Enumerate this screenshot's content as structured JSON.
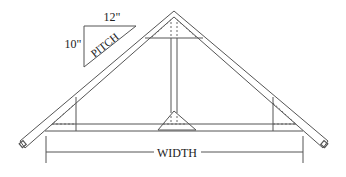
{
  "diagram": {
    "type": "roof-truss",
    "pitch_indicator": {
      "run_label": "12\"",
      "rise_label": "10\"",
      "title": "PITCH"
    },
    "dimension": {
      "label": "WIDTH"
    },
    "colors": {
      "line": "#555555",
      "dash": "#666666",
      "background": "#ffffff"
    }
  }
}
